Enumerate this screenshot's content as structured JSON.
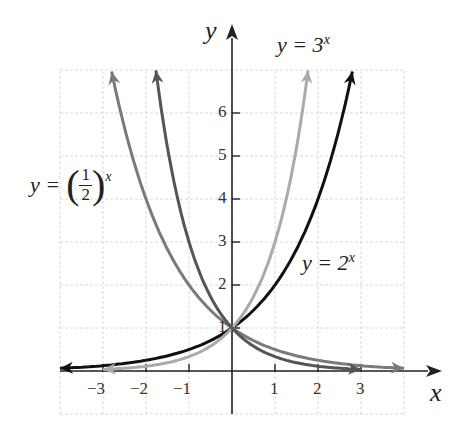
{
  "chart_data": {
    "type": "line",
    "title": "",
    "xlabel": "x",
    "ylabel": "y",
    "xlim": [
      -4,
      4
    ],
    "ylim": [
      -1,
      7
    ],
    "grid": true,
    "x_ticks": [
      "−3",
      "−2",
      "−1",
      "1",
      "2",
      "3"
    ],
    "y_ticks": [
      "1",
      "2",
      "3",
      "4",
      "5",
      "6"
    ],
    "series": [
      {
        "name": "y = 2^x",
        "label": "y = 2",
        "exp": "x",
        "color": "#111111",
        "x": [
          -4,
          -3,
          -2,
          -1,
          0,
          1,
          2,
          2.8
        ],
        "values": [
          0.0625,
          0.125,
          0.25,
          0.5,
          1,
          2,
          4,
          6.96
        ]
      },
      {
        "name": "y = 3^x",
        "label": "y = 3",
        "exp": "x",
        "color": "#aaaaaa",
        "x": [
          -3,
          -2,
          -1,
          0,
          1,
          1.77
        ],
        "values": [
          0.037,
          0.111,
          0.333,
          1,
          3,
          7.0
        ]
      },
      {
        "name": "y = (1/2)^x",
        "label": "y = (1/2)",
        "exp": "x",
        "color": "#7a7a7a",
        "x": [
          -2.8,
          -2,
          -1,
          0,
          1,
          2,
          3,
          4
        ],
        "values": [
          6.96,
          4,
          2,
          1,
          0.5,
          0.25,
          0.125,
          0.0625
        ]
      },
      {
        "name": "y = (1/3)^x",
        "label": "",
        "color": "#555555",
        "x": [
          -1.77,
          -1,
          0,
          1,
          2,
          3
        ],
        "values": [
          7.0,
          3,
          1,
          0.333,
          0.111,
          0.037
        ]
      }
    ]
  },
  "labels": {
    "y_axis": "y",
    "x_axis": "x",
    "eq_3x_base": "y = 3",
    "eq_3x_exp": "x",
    "eq_2x_base": "y = 2",
    "eq_2x_exp": "x",
    "eq_half_y": "y =",
    "eq_half_num": "1",
    "eq_half_den": "2",
    "eq_half_exp": "x"
  }
}
